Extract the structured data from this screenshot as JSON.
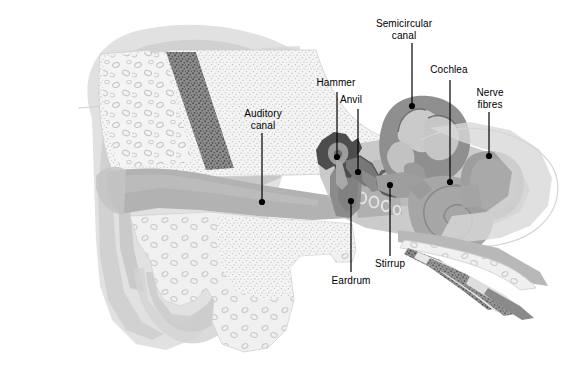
{
  "figure": {
    "background_color": "#ffffff",
    "width": 565,
    "height": 367
  },
  "palette": {
    "label_text": "#000000",
    "leader_line": "#000000",
    "pinna_outer": "#dcdcdc",
    "pinna_mid": "#d2d2d2",
    "pinna_inner": "#c8c8c8",
    "bone_fill": "#f2f2f2",
    "bone_stipple": "#b4b4b4",
    "diploe_dark": "#6e6e6e",
    "canal_gray": "#b0b0b0",
    "tissue_gray": "#bcbcbc",
    "ossicle_dark": "#4a4a4a",
    "eardrum_gray": "#8f8f8f",
    "cochlea_gray": "#a9a9a9",
    "labyrinth_gray": "#9a9a9a",
    "nerve_gray": "#a0a0a0"
  },
  "labels": [
    {
      "id": "auditory-canal",
      "text": "Auditory\ncanal",
      "text_x": 234,
      "text_y": 108,
      "text_w": 58,
      "leader": {
        "x1": 262,
        "y1": 133,
        "x2": 262,
        "y2": 200
      },
      "dot": {
        "cx": 262,
        "cy": 202,
        "r": 3.1
      }
    },
    {
      "id": "hammer",
      "text": "Hammer",
      "text_x": 310,
      "text_y": 77,
      "text_w": 52,
      "leader": {
        "x1": 337,
        "y1": 92,
        "x2": 337,
        "y2": 155
      },
      "dot": {
        "cx": 337,
        "cy": 157,
        "r": 3.1
      }
    },
    {
      "id": "anvil",
      "text": "Anvil",
      "text_x": 334,
      "text_y": 94,
      "text_w": 34,
      "leader": {
        "x1": 358,
        "y1": 109,
        "x2": 358,
        "y2": 170
      },
      "dot": {
        "cx": 358,
        "cy": 172,
        "r": 3.1
      }
    },
    {
      "id": "semicircular-canal",
      "text": "Semicircular\ncanal",
      "text_x": 372,
      "text_y": 18,
      "text_w": 64,
      "leader": {
        "x1": 412,
        "y1": 43,
        "x2": 412,
        "y2": 104
      },
      "dot": {
        "cx": 412,
        "cy": 106,
        "r": 3.1
      }
    },
    {
      "id": "cochlea",
      "text": "Cochlea",
      "text_x": 424,
      "text_y": 64,
      "text_w": 50,
      "leader": {
        "x1": 450,
        "y1": 80,
        "x2": 450,
        "y2": 180
      },
      "dot": {
        "cx": 450,
        "cy": 182,
        "r": 3.1
      }
    },
    {
      "id": "nerve-fibres",
      "text": "Nerve\nfibres",
      "text_x": 469,
      "text_y": 87,
      "text_w": 42,
      "leader": {
        "x1": 489,
        "y1": 112,
        "x2": 489,
        "y2": 154
      },
      "dot": {
        "cx": 489,
        "cy": 156,
        "r": 3.1
      }
    },
    {
      "id": "stirrup",
      "text": "Stirrup",
      "text_x": 368,
      "text_y": 258,
      "text_w": 44,
      "leader": {
        "x1": 390,
        "y1": 256,
        "x2": 390,
        "y2": 187
      },
      "dot": {
        "cx": 390,
        "cy": 185,
        "r": 3.1
      }
    },
    {
      "id": "eardrum",
      "text": "Eardrum",
      "text_x": 325,
      "text_y": 275,
      "text_w": 52,
      "leader": {
        "x1": 351,
        "y1": 272,
        "x2": 351,
        "y2": 203
      },
      "dot": {
        "cx": 351,
        "cy": 201,
        "r": 3.1
      }
    }
  ],
  "structures": [
    {
      "id": "pinna",
      "name": "Outer ear (pinna)"
    },
    {
      "id": "auditory-canal",
      "name": "Auditory canal"
    },
    {
      "id": "temporal-bone",
      "name": "Temporal bone"
    },
    {
      "id": "diploe",
      "name": "Diploe (cancellous bone band)"
    },
    {
      "id": "eardrum",
      "name": "Eardrum (tympanic membrane)"
    },
    {
      "id": "hammer",
      "name": "Hammer (malleus)"
    },
    {
      "id": "anvil",
      "name": "Anvil (incus)"
    },
    {
      "id": "stirrup",
      "name": "Stirrup (stapes)"
    },
    {
      "id": "semicircular-canal",
      "name": "Semicircular canals"
    },
    {
      "id": "cochlea",
      "name": "Cochlea"
    },
    {
      "id": "nerve-fibres",
      "name": "Nerve fibres"
    },
    {
      "id": "eustachian",
      "name": "Eustachian tube / lower bone bands"
    }
  ]
}
